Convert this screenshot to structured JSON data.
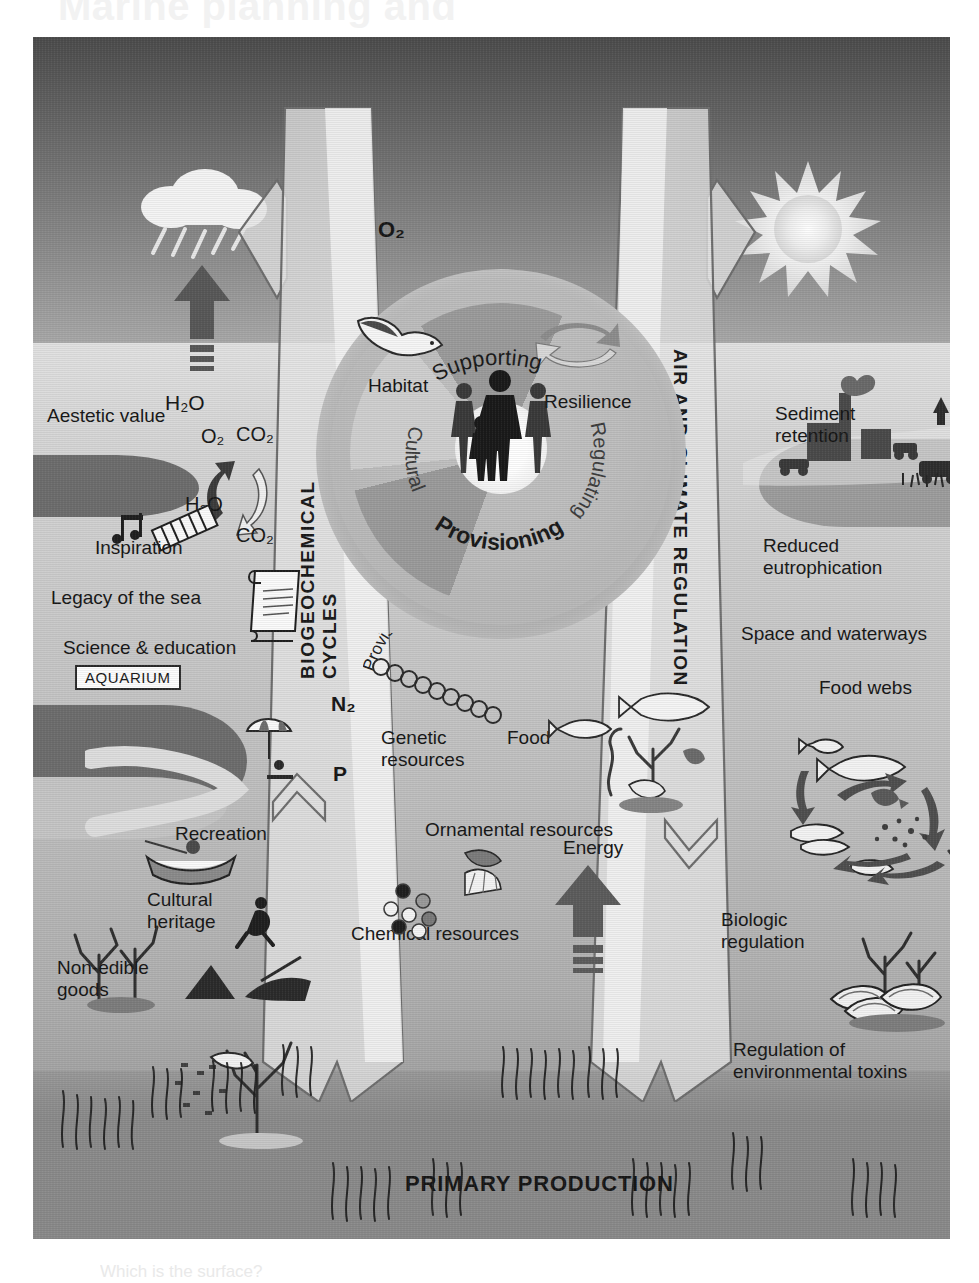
{
  "page": {
    "ghost_header": "Marine planning and",
    "cut_caption": "Which is the surface?"
  },
  "figure": {
    "title_bottom": "PRIMARY PRODUCTION",
    "vertical_axes": [
      {
        "id": "biogeochemical",
        "label": "BIOGEOCHEMICAL CYCLES"
      },
      {
        "id": "air-climate",
        "label": "AIR AND CLIMATE REGULATION"
      }
    ],
    "wheel": {
      "center_label": "",
      "top_label": "Supporting",
      "segments": [
        {
          "name": "Cultural",
          "tone": "#9b9b9b"
        },
        {
          "name": "Provisioning",
          "tone": "#cfcfcf"
        },
        {
          "name": "Regulating",
          "tone": "#9b9b9b"
        }
      ],
      "supporting_items": [
        {
          "name": "Habitat"
        },
        {
          "name": "Resilience"
        }
      ],
      "sub_label": "Provisioning biodiversity"
    },
    "atmosphere_labels": [
      {
        "name": "h2o-evaporation",
        "text": "H₂O"
      },
      {
        "name": "o2-output",
        "text": "O₂"
      }
    ],
    "gas_exchange": [
      {
        "name": "o2",
        "text": "O₂"
      },
      {
        "name": "co2-in",
        "text": "CO₂"
      },
      {
        "name": "h2o",
        "text": "H₂O"
      },
      {
        "name": "co2-out",
        "text": "CO₂"
      }
    ],
    "nutrients": [
      {
        "name": "nitrogen",
        "text": "N₂"
      },
      {
        "name": "phosphorus",
        "text": "P"
      }
    ],
    "cultural_services": [
      {
        "text": "Aestetic value"
      },
      {
        "text": "Inspiration"
      },
      {
        "text": "Legacy of the sea"
      },
      {
        "text": "Science & education"
      },
      {
        "text": "AQUARIUM"
      },
      {
        "text": "Recreation"
      },
      {
        "text": "Cultural\nheritage"
      },
      {
        "text": "Non-edible\ngoods"
      }
    ],
    "provisioning_services": [
      {
        "text": "Genetic\nresources"
      },
      {
        "text": "Food"
      },
      {
        "text": "Ornamental resources"
      },
      {
        "text": "Chemical resources"
      },
      {
        "text": "Energy"
      }
    ],
    "regulating_services": [
      {
        "text": "Sediment\nretention"
      },
      {
        "text": "Reduced\neutrophication"
      },
      {
        "text": "Space and waterways"
      },
      {
        "text": "Food webs"
      },
      {
        "text": "Biologic\nregulation"
      },
      {
        "text": "Regulation of\nenvironmental toxins"
      }
    ],
    "colors": {
      "sky_top": "#4c4c4c",
      "sky_bottom": "#a8a8a8",
      "sea_top": "#e2e2e2",
      "sea_bottom": "#8d8d8d",
      "seabed": "#8b8b8b",
      "text": "#171717",
      "wheel_dark": "#9b9b9b",
      "wheel_light": "#cfcfcf",
      "arrow_fill": "#e4e4e4",
      "arrow_stroke": "#6a6a6a",
      "dark_arrow": "#5f5f5f"
    }
  }
}
